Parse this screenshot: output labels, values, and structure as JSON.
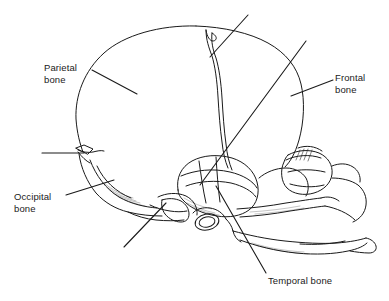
{
  "figure": {
    "kind": "anatomical-line-diagram",
    "background_color": "#ffffff",
    "line_color": "#1a1a1a",
    "text_color": "#1a1a1a"
  },
  "labels": {
    "parietal": "Parietal\nbone",
    "frontal": "Frontal\nbone",
    "occipital": "Occipital\nbone",
    "temporal": "Temporal bone"
  },
  "leaders": {
    "parietal": "leader-line-parietal",
    "frontal": "leader-line-frontal",
    "occipital": "leader-line-occipital",
    "temporal": "leader-line-temporal",
    "unlabeled_top": "leader-line-unlabeled-coronal-suture",
    "unlabeled_left": "leader-line-unlabeled-lambdoid-suture",
    "unlabeled_lower_left": "leader-line-unlabeled-mastoid",
    "unlabeled_long_diagonal": "leader-line-unlabeled-long-diagonal"
  },
  "anatomy_parts": {
    "cranial_vault": "cranial-vault-outline",
    "coronal_suture": "coronal-suture",
    "lambdoid_suture": "lambdoid-suture",
    "squamous_suture": "squamous-suture",
    "occipital_bone": "occipital-bone-region",
    "temporal_bone": "temporal-bone-region",
    "frontal_bone": "frontal-bone-region",
    "parietal_bone": "parietal-bone-region",
    "orbit": "orbit-eye-socket",
    "zygomatic_arch": "zygomatic-arch",
    "maxilla": "maxilla",
    "mandible": "mandible",
    "ear_canal": "external-acoustic-meatus"
  }
}
